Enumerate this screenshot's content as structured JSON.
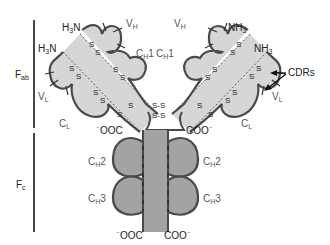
{
  "diagram": {
    "type": "antibody-structure",
    "regions": {
      "fab": {
        "label": "F",
        "subscript": "ab"
      },
      "fc": {
        "label": "F",
        "subscript": "c"
      }
    },
    "left_arm": {
      "heavy_n_terminus": {
        "label": "H",
        "sub": "3",
        "suffix": "N"
      },
      "light_n_terminus": {
        "label": "H",
        "sub": "3",
        "suffix": "N"
      },
      "vh": {
        "label": "V",
        "sub": "H"
      },
      "ch1": {
        "label": "C",
        "sub": "H",
        "suffix": "1"
      },
      "vl": {
        "label": "V",
        "sub": "L"
      },
      "cl": {
        "label": "C",
        "sub": "L"
      },
      "c_terminus": {
        "prefix": "⁻",
        "label": "OOC"
      }
    },
    "right_arm": {
      "heavy_n_terminus": {
        "label": "NH",
        "sub": "3"
      },
      "light_n_terminus": {
        "label": "NH",
        "sub": "3"
      },
      "vh": {
        "label": "V",
        "sub": "H"
      },
      "ch1": {
        "label": "C",
        "sub": "H",
        "suffix": "1"
      },
      "vl": {
        "label": "V",
        "sub": "L"
      },
      "cl": {
        "label": "C",
        "sub": "L"
      },
      "c_terminus": {
        "label": "COO",
        "suffix": "⁻"
      }
    },
    "cdr_callout": {
      "label": "CDRs"
    },
    "disulfide": {
      "label": "S",
      "bond": "S-S"
    },
    "fc_domains": {
      "ch2_left": {
        "label": "C",
        "sub": "H",
        "suffix": "2"
      },
      "ch2_right": {
        "label": "C",
        "sub": "H",
        "suffix": "2"
      },
      "ch3_left": {
        "label": "C",
        "sub": "H",
        "suffix": "3"
      },
      "ch3_right": {
        "label": "C",
        "sub": "H",
        "suffix": "3"
      }
    },
    "fc_termini": {
      "left": {
        "prefix": "⁻",
        "label": "OOC"
      },
      "right": {
        "label": "COO",
        "suffix": "⁻"
      }
    },
    "colors": {
      "light_fill": "#d6d6d6",
      "dark_fill": "#a3a3a3",
      "outline": "#4a4a4a",
      "text": "#222222"
    }
  }
}
